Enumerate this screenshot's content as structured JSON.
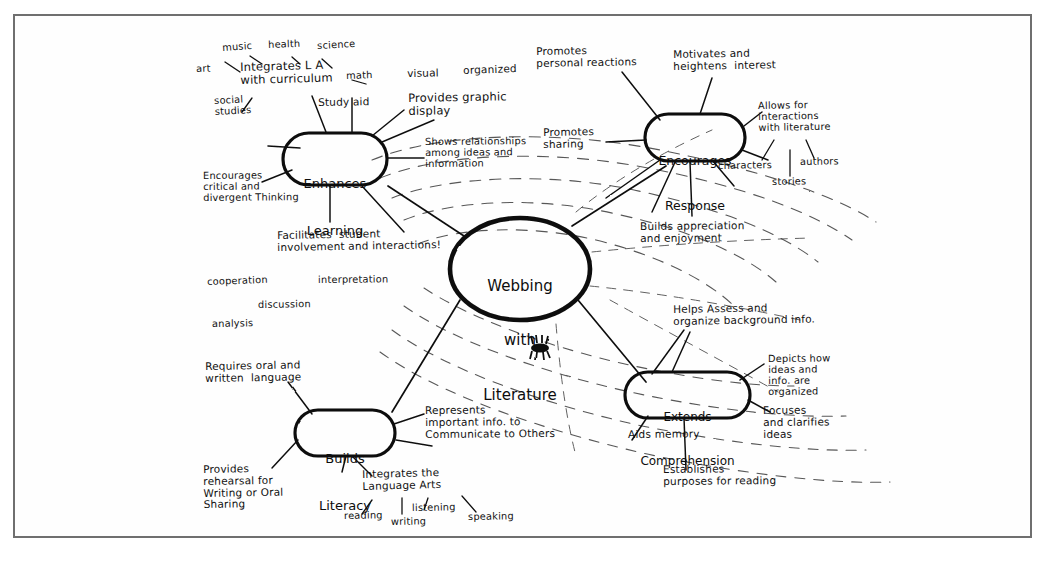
{
  "document": {
    "title": "Webbing with Literature",
    "media": "hand-drawn concept map photocopy",
    "frame_color": "#6f6f6f",
    "ink_color": "#111111",
    "paper_color": "#ffffff"
  },
  "center_node": {
    "label": "Webbing\nwith\nLiterature",
    "line1": "Webbing",
    "line2": "with",
    "line3": "Literature"
  },
  "spider_icon": {
    "name": "spider-icon",
    "caption": ""
  },
  "branches": [
    {
      "id": "enhances-learning",
      "label": "Enhances\nLearning",
      "line1": "Enhances",
      "line2": "Learning",
      "sub_nodes": [
        {
          "id": "integrates-curriculum",
          "text": "Integrates L A\nwith curriculum"
        },
        {
          "id": "art",
          "text": "art"
        },
        {
          "id": "music",
          "text": "music"
        },
        {
          "id": "health",
          "text": "health"
        },
        {
          "id": "science",
          "text": "science"
        },
        {
          "id": "math",
          "text": "math"
        },
        {
          "id": "social-studies",
          "text": "social\nstudies"
        },
        {
          "id": "study-aid",
          "text": "Study aid"
        },
        {
          "id": "provides-graphic-display",
          "text": "Provides graphic\ndisplay"
        },
        {
          "id": "visual",
          "text": "visual"
        },
        {
          "id": "organized",
          "text": "organized"
        },
        {
          "id": "shows-relationships",
          "text": "Shows relationships\namong ideas and\ninformation"
        },
        {
          "id": "encourages-critical-thinking",
          "text": "Encourages\ncritical and\ndivergent Thinking"
        },
        {
          "id": "facilitates-student-involvement",
          "text": "Facilitates  student\ninvolvement and interactions!"
        },
        {
          "id": "cooperation",
          "text": "cooperation"
        },
        {
          "id": "discussion",
          "text": "discussion"
        },
        {
          "id": "analysis",
          "text": "analysis"
        },
        {
          "id": "interpretation",
          "text": "interpretation"
        }
      ]
    },
    {
      "id": "encourages-response",
      "label": "Encourages\nResponse",
      "line1": "Encourages",
      "line2": "Response",
      "sub_nodes": [
        {
          "id": "promotes-personal-reactions",
          "text": "Promotes\npersonal reactions"
        },
        {
          "id": "motivates-heightens-interest",
          "text": "Motivates and\nheightens  interest"
        },
        {
          "id": "allows-interactions-literature",
          "text": "Allows for\ninteractions\nwith literature"
        },
        {
          "id": "characters",
          "text": "characters"
        },
        {
          "id": "authors",
          "text": "authors"
        },
        {
          "id": "stories",
          "text": "stories"
        },
        {
          "id": "promotes-sharing",
          "text": "Promotes\nsharing"
        },
        {
          "id": "builds-appreciation",
          "text": "Builds appreciation\nand enjoyment"
        }
      ]
    },
    {
      "id": "builds-literacy",
      "label": "Builds\nLiteracy",
      "line1": "Builds",
      "line2": "Literacy",
      "sub_nodes": [
        {
          "id": "requires-oral-written-language",
          "text": "Requires oral and\nwritten  language"
        },
        {
          "id": "represents-important-info",
          "text": "Represents\nimportant info. to\nCommunicate to Others"
        },
        {
          "id": "provides-rehearsal",
          "text": "Provides\nrehearsal for\nWriting or Oral\nSharing"
        },
        {
          "id": "integrates-language-arts",
          "text": "Integrates the\nLanguage Arts"
        },
        {
          "id": "reading",
          "text": "reading"
        },
        {
          "id": "writing",
          "text": "writing"
        },
        {
          "id": "listening",
          "text": "listening"
        },
        {
          "id": "speaking",
          "text": "speaking"
        }
      ]
    },
    {
      "id": "extends-comprehension",
      "label": "Extends\nComprehension",
      "line1": "Extends",
      "line2": "Comprehension",
      "sub_nodes": [
        {
          "id": "helps-assess-organize",
          "text": "Helps Assess and\norganize background info."
        },
        {
          "id": "depicts-how-organized",
          "text": "Depicts how\nideas and\ninfo. are\norganized"
        },
        {
          "id": "focuses-clarifies-ideas",
          "text": "Focuses\nand clarifies\nideas"
        },
        {
          "id": "aids-memory",
          "text": "Aids memory"
        },
        {
          "id": "establishes-purposes",
          "text": "Establishes\npurposes for reading"
        }
      ]
    }
  ]
}
